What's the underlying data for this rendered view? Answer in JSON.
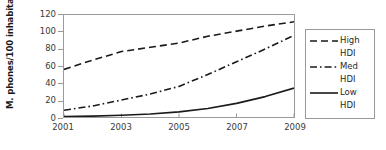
{
  "chart_data": {
    "type": "line",
    "title": "",
    "xlabel": "",
    "ylabel": "M. phones/100 inhabitants",
    "x": [
      2001,
      2002,
      2003,
      2004,
      2005,
      2006,
      2007,
      2008,
      2009
    ],
    "xlim": [
      2001,
      2009
    ],
    "ylim": [
      0,
      120
    ],
    "ytick_labels": [
      "0",
      "20",
      "40",
      "60",
      "80",
      "100",
      "120"
    ],
    "ytick_values": [
      0,
      20,
      40,
      60,
      80,
      100,
      120
    ],
    "xtick_labels": [
      "2001",
      "2003",
      "2005",
      "2007",
      "2009"
    ],
    "xtick_values": [
      2001,
      2003,
      2005,
      2007,
      2009
    ],
    "grid": false,
    "legend_position": "right",
    "series": [
      {
        "name": "High HDI",
        "label_line1": "High",
        "label_line2": "HDI",
        "style": "dashed",
        "color": "#1a1a1a",
        "values": [
          56,
          67,
          77,
          82,
          87,
          95,
          101,
          107,
          112
        ]
      },
      {
        "name": "Med HDI",
        "label_line1": "Med",
        "label_line2": "HDI",
        "style": "dash-dot",
        "color": "#1a1a1a",
        "values": [
          8,
          13,
          20,
          27,
          36,
          50,
          65,
          80,
          96
        ]
      },
      {
        "name": "Low HDI",
        "label_line1": "Low",
        "label_line2": "HDI",
        "style": "solid",
        "color": "#1a1a1a",
        "values": [
          0.5,
          1,
          2,
          3.5,
          6,
          10,
          16,
          24,
          34
        ]
      }
    ]
  }
}
